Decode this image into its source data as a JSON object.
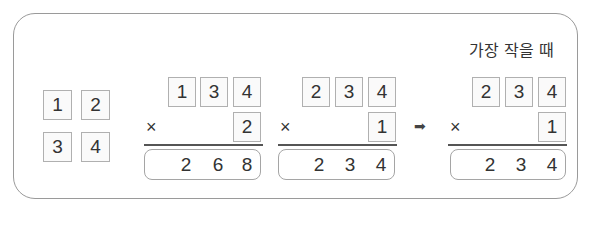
{
  "heading": "가장 작을 때",
  "tiles": [
    "1",
    "2",
    "3",
    "4"
  ],
  "operator": "×",
  "arrow": "➡",
  "problems": [
    {
      "top": [
        "1",
        "3",
        "4"
      ],
      "multiplier": "2",
      "result": [
        "2",
        "6",
        "8"
      ]
    },
    {
      "top": [
        "2",
        "3",
        "4"
      ],
      "multiplier": "1",
      "result": [
        "2",
        "3",
        "4"
      ]
    },
    {
      "top": [
        "2",
        "3",
        "4"
      ],
      "multiplier": "1",
      "result": [
        "2",
        "3",
        "4"
      ]
    }
  ],
  "colors": {
    "border": "#9a9a9a",
    "box_border": "#b0b0b0",
    "text": "#333333"
  }
}
